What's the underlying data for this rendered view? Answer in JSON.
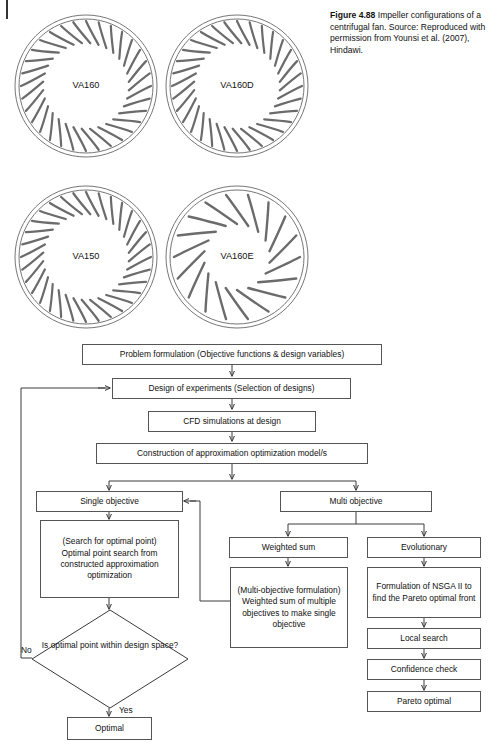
{
  "figure": {
    "caption_bold": "Figure 4.88",
    "caption_text": "  Impeller configurations of a centrifugal fan. Source: Reproduced with permission from Younsi et al. (2007), Hindawi."
  },
  "impellers": [
    {
      "label": "VA160",
      "blades": 32,
      "style": "forward-curved",
      "x": 12,
      "y": 12,
      "size": 148
    },
    {
      "label": "VA160D",
      "blades": 32,
      "style": "forward-curved",
      "x": 163,
      "y": 12,
      "size": 148
    },
    {
      "label": "VA150",
      "blades": 32,
      "style": "forward-curved",
      "x": 12,
      "y": 183,
      "size": 148
    },
    {
      "label": "VA160E",
      "blades": 18,
      "style": "backward-curved",
      "x": 163,
      "y": 183,
      "size": 148
    }
  ],
  "flowchart": {
    "nodes": {
      "problem_formulation": "Problem formulation (Objective functions & design variables)",
      "design_of_experiments": "Design of experiments (Selection of designs)",
      "cfd_simulations": "CFD simulations at design",
      "construction_model": "Construction of approximation optimization model/s",
      "single_objective": "Single objective",
      "multi_objective": "Multi objective",
      "search_optimal": "(Search for optimal point)\nOptimal point search from constructed approximation optimization",
      "weighted_sum": "Weighted sum",
      "evolutionary": "Evolutionary",
      "multi_objective_formulation": "(Multi-objective formulation)\nWeighted sum of multiple objectives to make single objective",
      "nsga_formulation": "Formulation of NSGA II to find the Pareto optimal front",
      "local_search": "Local search",
      "confidence_check": "Confidence check",
      "pareto_optimal": "Pareto optimal",
      "decision": "Is optimal point within design space?",
      "optimal": "Optimal"
    },
    "edge_labels": {
      "no": "No",
      "yes": "Yes"
    }
  },
  "colors": {
    "stroke": "#3a3a3a",
    "box_border": "#555555",
    "text": "#111111",
    "background": "#ffffff"
  }
}
